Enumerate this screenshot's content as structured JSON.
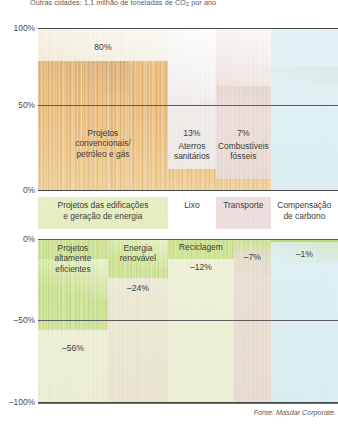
{
  "caption": "Outras cidades: 1,1 milhão de toneladas de CO2 por ano",
  "source": "Fonte: Masdar Corporate.",
  "axis": {
    "upper_ticks": [
      "100%",
      "50%",
      "0%"
    ],
    "lower_ticks": [
      "0%",
      "–50%",
      "–100%"
    ]
  },
  "categories": [
    "Projetos das edificações\ne geração de energia",
    "Lixo",
    "Transporte",
    "Compensação\nde carbono"
  ],
  "chart_data": {
    "type": "bar",
    "title": "Outras cidades: 1,1 milhão de toneladas de CO2 por ano",
    "subtitle": "",
    "xlabel": "",
    "ylabel": "",
    "grid": true,
    "legend": "none",
    "orientation": "vertical",
    "panels": [
      {
        "name": "emissoes",
        "ylim": [
          0,
          100
        ],
        "yticks": [
          0,
          50,
          100
        ],
        "ytick_labels": [
          "0%",
          "50%",
          "100%"
        ],
        "categories": [
          "Projetos convencionais/ petróleo e gás",
          "Aterros sanitários",
          "Combustíveis fósseis",
          "Compensação de carbono"
        ],
        "values": [
          80,
          13,
          7,
          0
        ],
        "value_labels": [
          "80%",
          "13%",
          "7%",
          ""
        ]
      },
      {
        "name": "reducoes",
        "ylim": [
          -100,
          0
        ],
        "yticks": [
          -100,
          -50,
          0
        ],
        "ytick_labels": [
          "–100%",
          "–50%",
          "0%"
        ],
        "categories": [
          "Projetos altamente eficientes",
          "Energia renovável",
          "Reciclagem",
          "Transporte",
          "Compensação de carbono"
        ],
        "values": [
          -56,
          -24,
          -12,
          -7,
          -1
        ],
        "value_labels": [
          "–56%",
          "–24%",
          "–12%",
          "–7%",
          "–1%"
        ]
      }
    ]
  },
  "upper_bars": [
    {
      "name": "Projetos\nconvencionais/\npetróleo e gás",
      "value_label": "80%"
    },
    {
      "name": "Aterros\nsanitários",
      "value_label": "13%"
    },
    {
      "name": "Combustíveis\nfósseis",
      "value_label": "7%"
    },
    {
      "name": "",
      "value_label": ""
    }
  ],
  "lower_bars": [
    {
      "name": "Projetos\naltamente\neficientes",
      "value_label": "–56%"
    },
    {
      "name": "Energia\nrenovável",
      "value_label": "–24%"
    },
    {
      "name": "Reciclagem",
      "value_label": "–12%"
    },
    {
      "name": "",
      "value_label": "–7%"
    },
    {
      "name": "",
      "value_label": "–1%"
    }
  ],
  "colors": {
    "bar_orange": "#e4ad62",
    "bar_green": "#c3dc7e",
    "panel_blue": "#dff0f3",
    "panel_cream": "#efe9d4",
    "panel_rose": "#e8d7d2",
    "axis": "#4a4a4a",
    "text": "#3c3c3c"
  }
}
